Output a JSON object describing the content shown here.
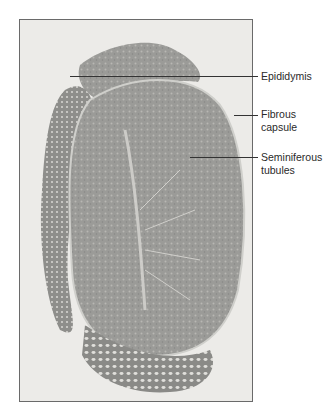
{
  "figure": {
    "labels": [
      {
        "id": "epididymis",
        "lines": [
          "Epididymis"
        ],
        "y": 76
      },
      {
        "id": "fibrous-capsule",
        "lines": [
          "Fibrous",
          "capsule"
        ],
        "y": 115
      },
      {
        "id": "seminiferous-tubules",
        "lines": [
          "Seminiferous",
          "tubules"
        ],
        "y": 157
      }
    ],
    "colors": {
      "background": "#ecebe8",
      "tissue_dark": "#8a8a88",
      "tissue_mid": "#a3a3a0",
      "tissue_light": "#c9c8c4",
      "text": "#2a2a2a"
    }
  }
}
